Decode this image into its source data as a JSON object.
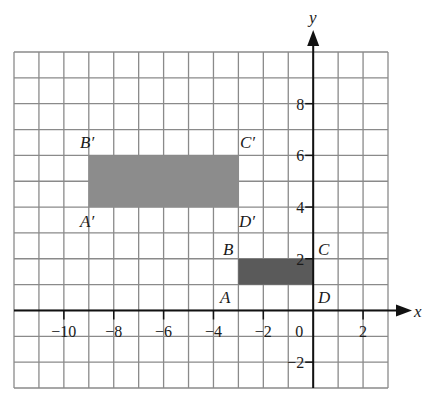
{
  "figure": {
    "type": "coordinate-grid-translation",
    "grid": {
      "x_min": -12,
      "x_max": 3,
      "y_min": -3,
      "y_max": 10,
      "line_color": "#8a8a8a"
    },
    "axes": {
      "x_label": "x",
      "y_label": "y",
      "x_ticks": [
        {
          "value": -10,
          "label": "−10"
        },
        {
          "value": -8,
          "label": "−8"
        },
        {
          "value": -6,
          "label": "−6"
        },
        {
          "value": -4,
          "label": "−4"
        },
        {
          "value": -2,
          "label": "−2"
        },
        {
          "value": 0,
          "label": "0"
        },
        {
          "value": 2,
          "label": "2"
        }
      ],
      "y_ticks": [
        {
          "value": 8,
          "label": "8"
        },
        {
          "value": 6,
          "label": "6"
        },
        {
          "value": 4,
          "label": "4"
        },
        {
          "value": 2,
          "label": "2"
        },
        {
          "value": -2,
          "label": "−2"
        }
      ]
    },
    "shapes": [
      {
        "name": "ABCD",
        "color": "#5a5a5a",
        "vertices": {
          "A": [
            -3,
            1
          ],
          "B": [
            -3,
            2
          ],
          "C": [
            0,
            2
          ],
          "D": [
            0,
            1
          ]
        }
      },
      {
        "name": "A'B'C'D'",
        "color": "#8c8c8c",
        "vertices": {
          "A'": [
            -9,
            4
          ],
          "B'": [
            -9,
            6
          ],
          "C'": [
            -3,
            6
          ],
          "D'": [
            -3,
            4
          ]
        }
      }
    ],
    "vertex_labels": {
      "A": "A",
      "B": "B",
      "C": "C",
      "D": "D",
      "A_prime": "A′",
      "B_prime": "B′",
      "C_prime": "C′",
      "D_prime": "D′"
    }
  }
}
